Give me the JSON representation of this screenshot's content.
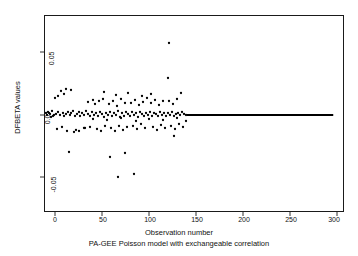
{
  "chart_data": {
    "type": "scatter",
    "title": "",
    "xlabel": "Observation number",
    "sublabel": "PA-GEE Poisson model with exchangeable correlation",
    "ylabel": "DFBETA values",
    "xlim": [
      -12,
      312
    ],
    "ylim": [
      -0.081,
      0.081
    ],
    "xticks": [
      0,
      50,
      100,
      150,
      200,
      250,
      300
    ],
    "xtick_labels": [
      "0",
      "50",
      "100",
      "150",
      "200",
      "250",
      "300"
    ],
    "yticks": [
      0.05,
      0.0,
      -0.05
    ],
    "ytick_labels": [
      "0.05",
      "0.0",
      "-0.05"
    ],
    "grid": false,
    "legend": null,
    "point_color": "#000000",
    "line_color": "#000000",
    "reference_line": {
      "y": 0.0,
      "x_start": 140,
      "x_end": 296,
      "width_px": 2.2
    },
    "x": [
      2,
      4,
      5,
      7,
      8,
      9,
      10,
      11,
      12,
      13,
      14,
      15,
      16,
      17,
      18,
      19,
      20,
      21,
      22,
      23,
      24,
      25,
      26,
      27,
      28,
      29,
      30,
      31,
      32,
      33,
      34,
      35,
      36,
      37,
      38,
      39,
      40,
      41,
      42,
      43,
      44,
      45,
      46,
      47,
      48,
      49,
      50,
      51,
      52,
      53,
      54,
      55,
      56,
      57,
      58,
      59,
      60,
      61,
      62,
      63,
      64,
      65,
      66,
      67,
      68,
      69,
      70,
      71,
      72,
      73,
      74,
      75,
      76,
      77,
      78,
      79,
      80,
      81,
      82,
      83,
      84,
      85,
      86,
      87,
      88,
      89,
      90,
      91,
      92,
      93,
      94,
      95,
      96,
      97,
      98,
      99,
      100,
      101,
      102,
      103,
      104,
      105,
      106,
      107,
      108,
      109,
      110,
      111,
      112,
      113,
      114,
      115,
      116,
      117,
      118,
      119,
      120,
      121,
      122,
      123,
      124,
      125,
      126,
      127,
      128,
      129,
      130,
      131,
      132,
      133,
      134,
      135,
      136,
      137,
      138,
      139,
      140
    ],
    "y": [
      0.0005,
      0.0155,
      0.0005,
      0.0005,
      0.0005,
      0.0165,
      0.0005,
      0.0,
      0.0,
      0.0,
      0.0175,
      0.0,
      0.0005,
      0.0,
      0.0,
      -0.0305,
      0.0,
      -0.0095,
      -0.0095,
      0.0,
      0.0,
      0.0,
      0.0,
      0.0,
      0.0,
      0.0005,
      0.0095,
      0.0,
      0.0,
      0.0,
      0.0,
      0.0,
      0.0,
      0.0,
      -0.0085,
      0.0,
      0.0225,
      0.0,
      0.0,
      0.0,
      0.0,
      0.0,
      0.0,
      0.0,
      0.0,
      0.0225,
      0.0,
      0.0,
      0.0,
      0.0,
      0.0,
      0.0,
      0.0,
      0.0,
      0.0,
      0.0,
      0.0,
      0.0,
      0.0,
      0.0,
      0.0,
      0.0,
      0.0,
      -0.0095,
      0.0,
      0.0,
      0.0,
      0.0,
      -0.0335,
      0.0,
      0.0,
      0.0,
      0.0,
      0.0,
      -0.0625,
      0.0,
      -0.0095,
      0.0,
      0.0,
      0.0,
      0.0,
      0.0,
      -0.0095,
      0.0,
      0.0,
      -0.0525,
      0.0,
      0.0,
      0.0,
      0.0,
      0.0,
      0.0,
      0.0,
      0.0,
      0.0,
      0.0,
      0.0,
      0.0,
      0.0,
      0.0,
      0.0,
      0.0,
      0.0,
      0.0,
      0.0,
      0.0,
      0.0,
      0.0,
      0.0,
      0.0,
      0.0,
      0.0,
      0.0,
      0.0,
      0.0,
      0.0,
      0.0,
      0.0,
      0.0,
      0.058,
      0.0,
      0.0,
      0.0,
      0.0,
      0.0,
      0.0,
      0.0,
      0.0,
      0.0,
      0.0,
      0.0,
      0.0,
      0.0,
      0.0,
      0.0
    ],
    "n_points": 140,
    "note": "DFBETA diagnostic scatter; values collapse to zero after observation ~140"
  },
  "points_px": [
    [
      49,
      113
    ],
    [
      52,
      111
    ],
    [
      54,
      115
    ],
    [
      56,
      114
    ],
    [
      58,
      112
    ],
    [
      60,
      115
    ],
    [
      61,
      91
    ],
    [
      63,
      113
    ],
    [
      64,
      116
    ],
    [
      66,
      114
    ],
    [
      55,
      98
    ],
    [
      58,
      96
    ],
    [
      64,
      94
    ],
    [
      68,
      112
    ],
    [
      70,
      115
    ],
    [
      71,
      113
    ],
    [
      73,
      111
    ],
    [
      75,
      116
    ],
    [
      66,
      89
    ],
    [
      71,
      90
    ],
    [
      77,
      114
    ],
    [
      79,
      112
    ],
    [
      80,
      116
    ],
    [
      82,
      113
    ],
    [
      84,
      115
    ],
    [
      86,
      111
    ],
    [
      88,
      114
    ],
    [
      90,
      116
    ],
    [
      92,
      112
    ],
    [
      94,
      115
    ],
    [
      76,
      130
    ],
    [
      79,
      131
    ],
    [
      84,
      128
    ],
    [
      74,
      132
    ],
    [
      96,
      113
    ],
    [
      98,
      116
    ],
    [
      100,
      112
    ],
    [
      102,
      114
    ],
    [
      104,
      117
    ],
    [
      106,
      113
    ],
    [
      88,
      102
    ],
    [
      93,
      100
    ],
    [
      95,
      104
    ],
    [
      99,
      101
    ],
    [
      103,
      99
    ],
    [
      90,
      127
    ],
    [
      97,
      129
    ],
    [
      101,
      131
    ],
    [
      105,
      126
    ],
    [
      108,
      115
    ],
    [
      110,
      112
    ],
    [
      112,
      116
    ],
    [
      114,
      113
    ],
    [
      116,
      115
    ],
    [
      118,
      111
    ],
    [
      120,
      117
    ],
    [
      122,
      113
    ],
    [
      124,
      116
    ],
    [
      126,
      112
    ],
    [
      109,
      104
    ],
    [
      113,
      101
    ],
    [
      117,
      106
    ],
    [
      121,
      99
    ],
    [
      125,
      103
    ],
    [
      111,
      128
    ],
    [
      115,
      131
    ],
    [
      119,
      126
    ],
    [
      123,
      130
    ],
    [
      127,
      127
    ],
    [
      128,
      114
    ],
    [
      130,
      116
    ],
    [
      132,
      112
    ],
    [
      134,
      115
    ],
    [
      136,
      113
    ],
    [
      138,
      117
    ],
    [
      140,
      112
    ],
    [
      142,
      114
    ],
    [
      144,
      116
    ],
    [
      146,
      113
    ],
    [
      131,
      103
    ],
    [
      135,
      100
    ],
    [
      139,
      105
    ],
    [
      143,
      102
    ],
    [
      147,
      98
    ],
    [
      133,
      126
    ],
    [
      137,
      129
    ],
    [
      141,
      124
    ],
    [
      145,
      128
    ],
    [
      148,
      115
    ],
    [
      150,
      112
    ],
    [
      152,
      116
    ],
    [
      154,
      113
    ],
    [
      156,
      114
    ],
    [
      158,
      116
    ],
    [
      160,
      112
    ],
    [
      162,
      115
    ],
    [
      164,
      113
    ],
    [
      166,
      116
    ],
    [
      151,
      103
    ],
    [
      155,
      100
    ],
    [
      159,
      105
    ],
    [
      163,
      101
    ],
    [
      153,
      127
    ],
    [
      157,
      130
    ],
    [
      161,
      125
    ],
    [
      165,
      128
    ],
    [
      168,
      113
    ],
    [
      170,
      115
    ],
    [
      172,
      112
    ],
    [
      174,
      116
    ],
    [
      176,
      114
    ],
    [
      178,
      113
    ],
    [
      180,
      115
    ],
    [
      182,
      112
    ],
    [
      184,
      114
    ],
    [
      186,
      115
    ],
    [
      169,
      101
    ],
    [
      173,
      104
    ],
    [
      177,
      99
    ],
    [
      171,
      126
    ],
    [
      175,
      129
    ],
    [
      179,
      124
    ],
    [
      183,
      127
    ],
    [
      85,
      128
    ],
    [
      62,
      127
    ],
    [
      67,
      131
    ],
    [
      57,
      129
    ],
    [
      69,
      152
    ],
    [
      118,
      177
    ],
    [
      125,
      153
    ],
    [
      134,
      174
    ],
    [
      110,
      157
    ],
    [
      169,
      43
    ],
    [
      168,
      78
    ],
    [
      181,
      93
    ],
    [
      174,
      136
    ],
    [
      186,
      121
    ],
    [
      48,
      112
    ],
    [
      50,
      114
    ],
    [
      53,
      116
    ],
    [
      47,
      115
    ],
    [
      46,
      113
    ],
    [
      51,
      117
    ],
    [
      104,
      92
    ],
    [
      116,
      95
    ],
    [
      128,
      93
    ],
    [
      142,
      96
    ],
    [
      151,
      94
    ],
    [
      93,
      119
    ],
    [
      107,
      120
    ],
    [
      121,
      118
    ],
    [
      136,
      121
    ],
    [
      149,
      119
    ],
    [
      163,
      120
    ],
    [
      177,
      118
    ]
  ],
  "axis": {
    "frame": {
      "left": 44,
      "top": 15,
      "width": 300,
      "height": 197
    },
    "x_pixel_per_unit": 0.94,
    "x_origin_px": 55,
    "y_zero_px": 115,
    "y_005_px": 52,
    "y_neg005_px": 177
  }
}
